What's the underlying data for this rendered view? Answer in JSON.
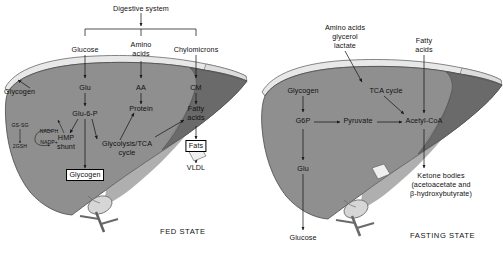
{
  "figure": {
    "panels": [
      "FED STATE",
      "FASTING STATE"
    ]
  },
  "colors": {
    "liver_main": "#8f8f8f",
    "liver_dark": "#6a6a6a",
    "liver_darkest": "#575757",
    "liver_light": "#c8c8c8",
    "gallbladder": "#d6d6d6",
    "rim": "#e8e8e8",
    "outline": "#3a3a3a",
    "text": "#111111",
    "background": "#ffffff"
  },
  "fed_state": {
    "caption": "FED STATE",
    "source": "Digestive system",
    "inputs": [
      {
        "label": "Glucose"
      },
      {
        "label": "Amino\nacids",
        "line1": "Amino",
        "line2": "acids"
      },
      {
        "label": "Chylomicrons"
      }
    ],
    "nodes": {
      "glu": "Glu",
      "aa": "AA",
      "cm": "CM",
      "glu6p": "Glu-6-P",
      "protein": "Protein",
      "fatty_acids_l1": "Fatty",
      "fatty_acids_l2": "acids",
      "hmp_l1": "HMP",
      "hmp_l2": "shunt",
      "glycolysis_l1": "Glycolysis/TCA",
      "glycolysis_l2": "cycle",
      "fats": "Fats",
      "vldl": "VLDL",
      "glycogen_store": "Glycogen",
      "glycogen_out": "Glycogen"
    },
    "redox": {
      "gssg": "GS-SG",
      "gsh": "2GSH",
      "nadph": "NADPH",
      "nadp": "NADP+"
    }
  },
  "fasting_state": {
    "caption": "FASTING STATE",
    "inputs": {
      "substrates_l1": "Amino acids",
      "substrates_l2": "glycerol",
      "substrates_l3": "lactate",
      "fatty_l1": "Fatty",
      "fatty_l2": "acids"
    },
    "nodes": {
      "glycogen": "Glycogen",
      "tca": "TCA cycle",
      "g6p": "G6P",
      "pyruvate": "Pyruvate",
      "acetyl_coa": "Acetyl-CoA",
      "glu": "Glu",
      "glucose_out": "Glucose",
      "ketone_l1": "Ketone bodies",
      "ketone_l2": "(acetoacetate and",
      "ketone_l3": "β-hydroxybutyrate)"
    }
  }
}
